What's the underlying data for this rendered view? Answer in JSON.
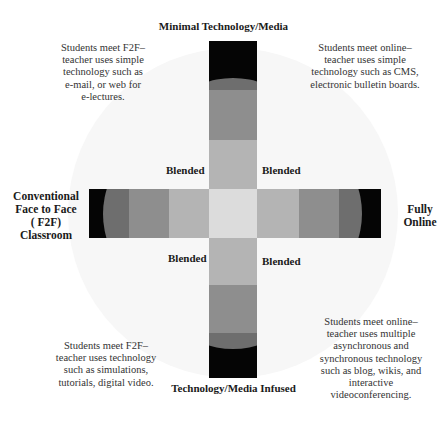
{
  "diagram": {
    "axes": {
      "top": "Minimal Technology/Media",
      "bottom": "Technology/Media Infused",
      "left": [
        "Conventional",
        "Face to Face",
        "( F2F)",
        "Classroom"
      ],
      "right": [
        "Fully",
        "Online"
      ]
    },
    "quadrant_labels": {
      "top_left": "Blended",
      "top_right": "Blended",
      "bottom_left": "Blended",
      "bottom_right": "Blended"
    },
    "descriptions": {
      "top_left": [
        "Students meet F2F–",
        "teacher uses simple",
        "technology such as",
        "e-mail, or web for",
        "e-lectures."
      ],
      "top_right": [
        "Students meet online–",
        "teacher uses simple",
        "technology such as CMS,",
        "electronic bulletin boards."
      ],
      "bottom_left": [
        "Students meet F2F–",
        "teacher uses technology",
        "such as simulations,",
        "tutorials, digital video."
      ],
      "bottom_right": [
        "Students meet online–",
        "teacher uses multiple",
        "asynchronous and",
        "synchronous technology",
        "such as blog, wikis, and",
        "interactive",
        "videoconferencing."
      ]
    },
    "colors": {
      "extreme": "#050505",
      "dark": "#6e6e6e",
      "mid": "#8e8e8e",
      "light": "#b4b4b4",
      "center": "#dcdcdc",
      "circle": "#f7f7f7"
    }
  }
}
